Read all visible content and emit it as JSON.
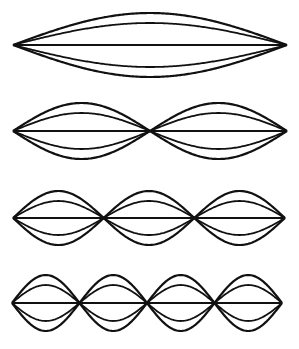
{
  "figure": {
    "stroke_color": "#111111",
    "background": "#ffffff",
    "rows": [
      {
        "harmonic": 1,
        "x_start": 13,
        "x_end": 287,
        "axis_y": 45,
        "outer_amplitude": 32,
        "inner_amplitude": 22
      },
      {
        "harmonic": 2,
        "x_start": 13,
        "x_end": 287,
        "axis_y": 131,
        "outer_amplitude": 28,
        "inner_amplitude": 18
      },
      {
        "harmonic": 3,
        "x_start": 13,
        "x_end": 285,
        "axis_y": 218,
        "outer_amplitude": 27,
        "inner_amplitude": 17
      },
      {
        "harmonic": 4,
        "x_start": 12,
        "x_end": 282,
        "axis_y": 303,
        "outer_amplitude": 28,
        "inner_amplitude": 18
      }
    ]
  }
}
